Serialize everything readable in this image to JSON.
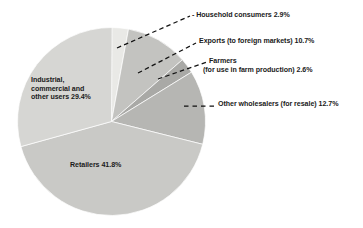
{
  "chart_data": {
    "type": "pie",
    "title": "",
    "subtitle": "",
    "xlabel": "",
    "ylabel": "",
    "legend_position": "callout-labels",
    "grid": false,
    "start_angle_deg": 0,
    "direction": "clockwise",
    "total_percent": 100.1,
    "categories": [
      "Household consumers",
      "Exports (to foreign markets)",
      "Farmers (for use in farm production)",
      "Other wholesalers (for resale)",
      "Retailers",
      "Industrial, commercial and other users"
    ],
    "values": [
      2.9,
      10.7,
      2.6,
      12.7,
      41.8,
      29.4
    ],
    "slices": [
      {
        "name": "household-consumers",
        "label": "Household consumers 2.9%",
        "label_text": "Household consumers",
        "value": 2.9,
        "value_text": "2.9%",
        "color": "#e9e9e6",
        "start_deg": 0,
        "sweep_deg": 10.44,
        "label_placement": "callout-right"
      },
      {
        "name": "exports-foreign-markets",
        "label": "Exports (to foreign markets) 10.7%",
        "label_text": "Exports (to foreign markets)",
        "value": 10.7,
        "value_text": "10.7%",
        "color": "#c3c3c0",
        "start_deg": 10.44,
        "sweep_deg": 38.52,
        "label_placement": "callout-right"
      },
      {
        "name": "farmers-farm-production",
        "label_line1": "Farmers",
        "label_line2": "(for use in farm production)  2.6%",
        "label_text": "Farmers (for use in farm production)",
        "value": 2.6,
        "value_text": "2.6%",
        "color": "#a9a9a6",
        "start_deg": 48.96,
        "sweep_deg": 9.36,
        "label_placement": "callout-right"
      },
      {
        "name": "other-wholesalers-resale",
        "label": "Other wholesalers (for resale) 12.7%",
        "label_text": "Other wholesalers (for resale)",
        "value": 12.7,
        "value_text": "12.7%",
        "color": "#b6b6b3",
        "start_deg": 58.32,
        "sweep_deg": 45.72,
        "label_placement": "callout-right"
      },
      {
        "name": "retailers",
        "label": "Retailers 41.8%",
        "label_text": "Retailers",
        "value": 41.8,
        "value_text": "41.8%",
        "color": "#c9c9c6",
        "start_deg": 104.04,
        "sweep_deg": 150.48,
        "label_placement": "inside"
      },
      {
        "name": "industrial-commercial-other-users",
        "label_line1": "Industrial,",
        "label_line2": "commercial",
        "label_line3": "and other",
        "label_line4": "users 29.4%",
        "label_text": "Industrial, commercial and other users",
        "value": 29.4,
        "value_text": "29.4%",
        "color": "#d6d6d3",
        "start_deg": 254.52,
        "sweep_deg": 105.84,
        "label_placement": "inside"
      }
    ]
  },
  "labels": {
    "household": "- Household consumers 2.9%",
    "exports": "Exports (to foreign markets) 10.7%",
    "farmers_line1": "Farmers",
    "farmers_line2": "(for use in farm production)  2.6%",
    "wholesalers": "Other wholesalers (for resale) 12.7%",
    "industrial": "Industrial, commercial and other users 29.4%",
    "retailers": "Retailers 41.8%"
  },
  "colors": {
    "background": "#ffffff",
    "text": "#1a1a1a",
    "leader_line": "#111111",
    "slice_divider": "#ffffff"
  }
}
